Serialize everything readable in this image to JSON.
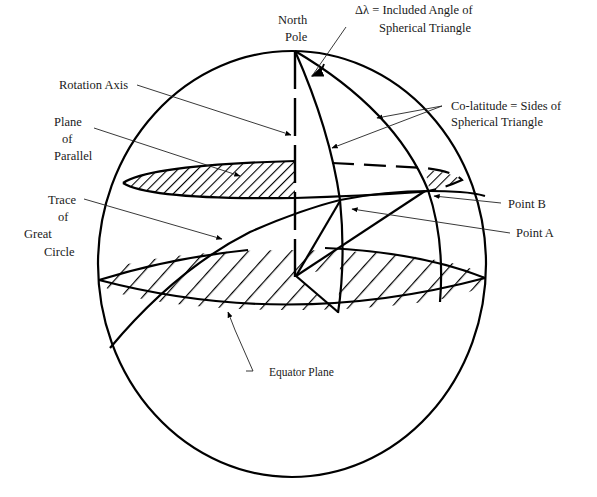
{
  "diagram": {
    "labels": {
      "north_pole": [
        "North",
        "Pole"
      ],
      "delta_lambda": [
        "Δλ  =  Included Angle of",
        "Spherical Triangle"
      ],
      "rotation_axis": "Rotation Axis",
      "plane_of_parallel": [
        "Plane",
        "of",
        "Parallel"
      ],
      "co_latitude": [
        "Co-latitude = Sides of",
        "Spherical Triangle"
      ],
      "trace_great_circle": [
        "Trace",
        "of",
        "Great",
        "Circle"
      ],
      "point_b": "Point B",
      "point_a": "Point A",
      "equator_plane": "Equator Plane"
    },
    "elements": [
      "sphere-outline",
      "rotation-axis (dashed)",
      "plane-of-parallel (hatched ellipse)",
      "equator-plane (hatched ellipse)",
      "meridian-through-point-a",
      "meridian-through-point-b",
      "great-circle-trace",
      "included-angle-arc"
    ],
    "colors": {
      "ink": "#000000",
      "background": "#ffffff"
    }
  }
}
